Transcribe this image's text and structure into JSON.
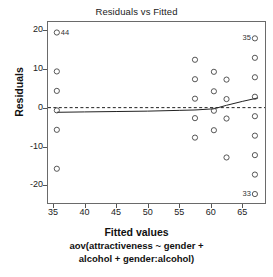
{
  "chart_data": {
    "type": "scatter",
    "title": "Residuals vs Fitted",
    "xlabel": "Fitted values",
    "ylabel": "Residuals",
    "caption_line1": "aov(attractiveness ~ gender +",
    "caption_line2": "alcohol + gender:alcohol)",
    "xlim": [
      34.2,
      68.6
    ],
    "ylim": [
      -24.5,
      22.0
    ],
    "xticks": [
      35,
      40,
      45,
      50,
      55,
      60,
      65
    ],
    "yticks": [
      20,
      10,
      0,
      -10,
      -20
    ],
    "xtick_labels": [
      "35",
      "40",
      "45",
      "50",
      "55",
      "60",
      "65"
    ],
    "ytick_labels": [
      "20",
      "10",
      "0",
      "-10",
      "-20"
    ],
    "grid": false,
    "legend": "none",
    "point_marker": "open-circle",
    "point_color": "#444444",
    "zero_line": {
      "y": 0,
      "style": "dashed",
      "color": "#222222"
    },
    "smoother": {
      "style": "solid",
      "color": "#222222",
      "points": [
        {
          "x": 35.6,
          "y": -1.2
        },
        {
          "x": 40.0,
          "y": -1.1
        },
        {
          "x": 45.0,
          "y": -1.0
        },
        {
          "x": 50.0,
          "y": -0.9
        },
        {
          "x": 55.0,
          "y": -0.7
        },
        {
          "x": 57.5,
          "y": -0.6
        },
        {
          "x": 60.5,
          "y": -0.3
        },
        {
          "x": 62.5,
          "y": 0.6
        },
        {
          "x": 65.0,
          "y": 1.6
        },
        {
          "x": 67.5,
          "y": 2.5
        }
      ]
    },
    "points": [
      {
        "x": 35.6,
        "y": 19.3,
        "label": "44",
        "label_pos": "right"
      },
      {
        "x": 35.6,
        "y": 9.3
      },
      {
        "x": 35.6,
        "y": 4.3
      },
      {
        "x": 35.6,
        "y": -0.7
      },
      {
        "x": 35.6,
        "y": -5.7
      },
      {
        "x": 35.6,
        "y": -15.7
      },
      {
        "x": 57.5,
        "y": 12.3
      },
      {
        "x": 57.5,
        "y": 7.3
      },
      {
        "x": 57.5,
        "y": 2.3
      },
      {
        "x": 57.5,
        "y": -2.7
      },
      {
        "x": 57.5,
        "y": -7.7
      },
      {
        "x": 60.5,
        "y": 9.2
      },
      {
        "x": 60.5,
        "y": 4.2
      },
      {
        "x": 60.5,
        "y": -0.8
      },
      {
        "x": 60.5,
        "y": -5.8
      },
      {
        "x": 62.5,
        "y": 7.2
      },
      {
        "x": 62.5,
        "y": 2.2
      },
      {
        "x": 62.5,
        "y": -2.8
      },
      {
        "x": 62.5,
        "y": -12.8
      },
      {
        "x": 67.0,
        "y": 17.8,
        "label": "35",
        "label_pos": "left"
      },
      {
        "x": 67.0,
        "y": 12.8
      },
      {
        "x": 67.0,
        "y": 7.8
      },
      {
        "x": 67.0,
        "y": 2.8
      },
      {
        "x": 67.0,
        "y": -2.2
      },
      {
        "x": 67.0,
        "y": -7.2
      },
      {
        "x": 67.0,
        "y": -12.2
      },
      {
        "x": 67.0,
        "y": -17.2
      },
      {
        "x": 67.0,
        "y": -22.2,
        "label": "33",
        "label_pos": "left"
      }
    ]
  }
}
